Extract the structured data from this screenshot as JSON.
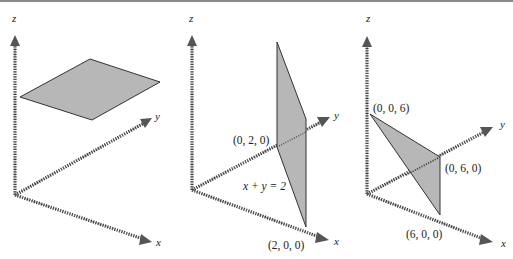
{
  "figure": {
    "panels": [
      {
        "id": "panel-1",
        "axes": {
          "x": "x",
          "y": "y",
          "z": "z"
        },
        "shape": "horizontal-plane",
        "point_labels": [],
        "equation": ""
      },
      {
        "id": "panel-2",
        "axes": {
          "x": "x",
          "y": "y",
          "z": "z"
        },
        "shape": "vertical-plane",
        "point_labels": [
          "(0, 2, 0)",
          "(2, 0, 0)"
        ],
        "equation": "x + y = 2"
      },
      {
        "id": "panel-3",
        "axes": {
          "x": "x",
          "y": "y",
          "z": "z"
        },
        "shape": "triangle-plane",
        "point_labels": [
          "(0, 0, 6)",
          "(0, 6, 0)",
          "(6, 0, 0)"
        ],
        "equation": ""
      }
    ],
    "colors": {
      "plane_fill": "#b7b7b7",
      "plane_edge": "#333333",
      "axis": "#3a3a3a"
    }
  }
}
